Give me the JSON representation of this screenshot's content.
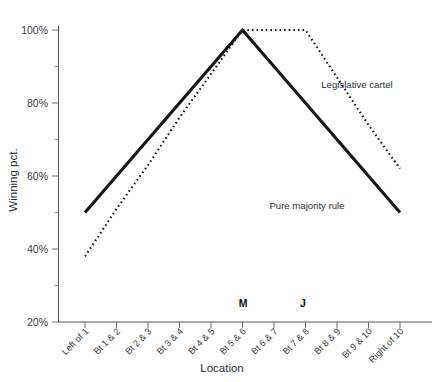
{
  "chart_data": {
    "type": "line",
    "title": "",
    "xlabel": "Location",
    "ylabel": "Winning pct.",
    "grid": false,
    "legend_position": "inline-annotation",
    "ylim": [
      20,
      100
    ],
    "ytick_labels": [
      "20%",
      "40%",
      "60%",
      "80%",
      "100%"
    ],
    "ytick_values": [
      20,
      40,
      60,
      80,
      100
    ],
    "yminor_values": [
      30,
      50,
      70,
      90
    ],
    "categories": [
      "Left of 1",
      "Bt 1 & 2",
      "Bt 2 & 3",
      "Bt 3 & 4",
      "Bt 4 & 5",
      "Bt 5 & 6",
      "Bt 6 & 7",
      "Bt 7 & 8",
      "Bt 8 & 9",
      "Bt 9 & 10",
      "Right of 10"
    ],
    "series": [
      {
        "name": "Pure majority rule",
        "style": "solid",
        "values": [
          50,
          60,
          70,
          80,
          90,
          100,
          90,
          80,
          70,
          60,
          50
        ]
      },
      {
        "name": "Legislative cartel",
        "style": "dotted",
        "values": [
          38,
          51,
          63,
          76,
          88,
          100,
          100,
          100,
          87,
          74,
          62
        ]
      }
    ],
    "annotations": [
      {
        "text": "Legislative cartel",
        "x_px": 357,
        "y_px": 88
      },
      {
        "text": "Pure majority rule",
        "x_px": 307,
        "y_px": 209
      }
    ],
    "axis_markers": [
      {
        "label": "M",
        "category": "Bt 5 & 6",
        "x_px": 243
      },
      {
        "label": "J",
        "category": "Bt 7 & 8",
        "x_px": 303
      }
    ]
  }
}
